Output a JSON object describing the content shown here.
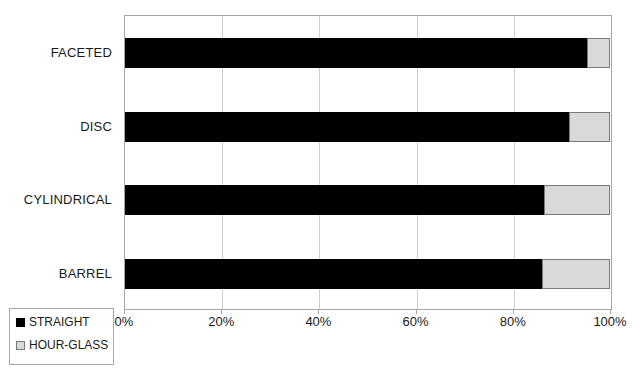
{
  "chart_data": {
    "type": "bar",
    "orientation": "horizontal",
    "stacked": true,
    "normalized": "100%",
    "title": "",
    "subtitle": "",
    "xlabel": "",
    "ylabel": "",
    "xlim": [
      0,
      100
    ],
    "xticks": [
      "0%",
      "20%",
      "40%",
      "60%",
      "80%",
      "100%"
    ],
    "xtick_values": [
      0,
      20,
      40,
      60,
      80,
      100
    ],
    "grid": "vertical",
    "legend_position": "bottom-left",
    "categories": [
      "FACETED",
      "DISC",
      "CYLINDRICAL",
      "BARREL"
    ],
    "series": [
      {
        "name": "STRAIGHT",
        "color": "#000000",
        "values": [
          95.3,
          91.5,
          86.5,
          86.0
        ]
      },
      {
        "name": "HOUR-GLASS",
        "color": "#d9d9d9",
        "values": [
          4.7,
          8.5,
          13.5,
          14.0
        ]
      }
    ]
  },
  "legend": {
    "items": [
      {
        "label": "STRAIGHT",
        "swatch": "black-square-icon"
      },
      {
        "label": "HOUR-GLASS",
        "swatch": "gray-square-icon"
      }
    ]
  },
  "colors": {
    "straight": "#000000",
    "hourglass": "#d9d9d9",
    "axis": "#a6a6a6",
    "grid": "#d0d0d0",
    "text": "#1a1a1a",
    "background": "#ffffff"
  }
}
